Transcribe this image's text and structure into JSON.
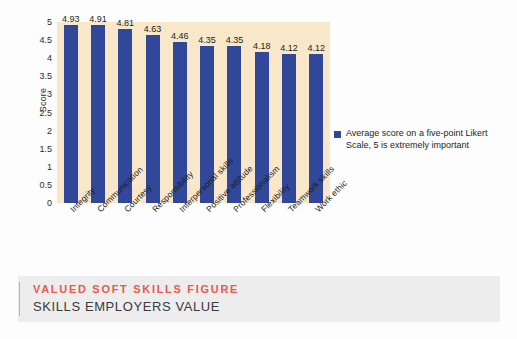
{
  "chart_data": {
    "type": "bar",
    "title": "",
    "xlabel": "",
    "ylabel": "Score",
    "ylim": [
      0,
      5
    ],
    "yticks": [
      "0",
      "0.5",
      "1",
      "1.5",
      "2",
      "2.5",
      "3",
      "3.5",
      "4",
      "4.5",
      "5"
    ],
    "grid": false,
    "legend_position": "right",
    "categories": [
      "Integrity",
      "Communication",
      "Courtesy",
      "Responsibility",
      "Interpersonal skills",
      "Positive attitude",
      "Professionalism",
      "Flexibility",
      "Teamwork skills",
      "Work ethic"
    ],
    "values": [
      4.93,
      4.91,
      4.81,
      4.63,
      4.46,
      4.35,
      4.35,
      4.18,
      4.12,
      4.12
    ],
    "value_labels": [
      "4.93",
      "4.91",
      "4.81",
      "4.63",
      "4.46",
      "4.35",
      "4.35",
      "4.18",
      "4.12",
      "4.12"
    ],
    "series": [
      {
        "name": "Average score on a five-point Likert Scale, 5 is extremely important",
        "color": "#31479a",
        "values": [
          4.93,
          4.91,
          4.81,
          4.63,
          4.46,
          4.35,
          4.35,
          4.18,
          4.12,
          4.12
        ]
      }
    ]
  },
  "legend": {
    "text": "Average score on a five-point Likert Scale, 5 is extremely important"
  },
  "caption": {
    "kicker": "VALUED SOFT SKILLS FIGURE",
    "title": "SKILLS EMPLOYERS VALUE"
  },
  "colors": {
    "bar": "#31479a",
    "plot_background": "#f8e8c9",
    "page_background": "#fdfdfd",
    "caption_band": "#ededed",
    "caption_kicker": "#e8594e",
    "caption_title": "#3a3a3a"
  }
}
